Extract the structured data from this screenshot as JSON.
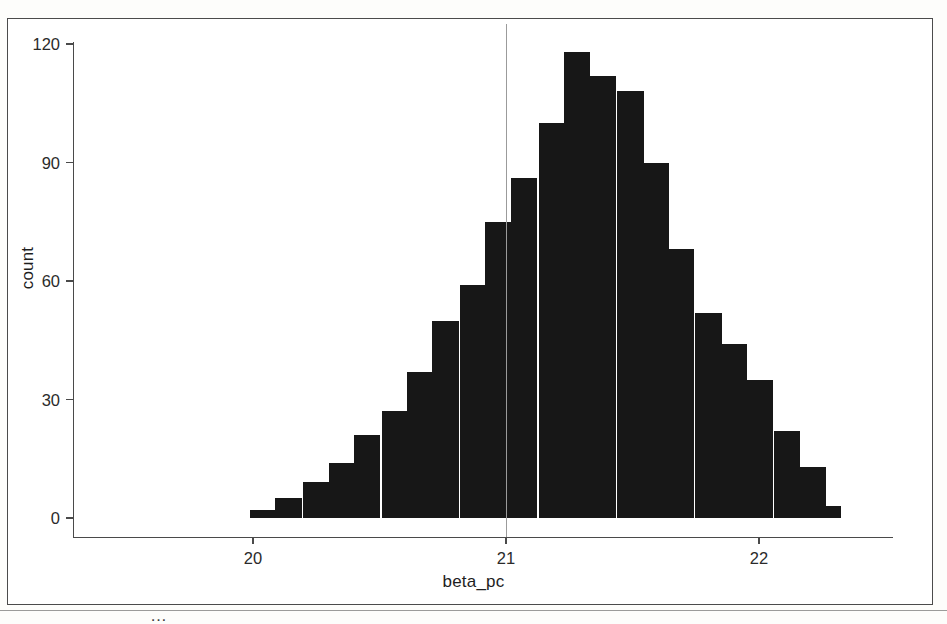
{
  "figure": {
    "kind": "histogram-figure",
    "caption_fragment": "…",
    "frame_color": "#4b4b4b",
    "bar_color": "#171717",
    "reference_line_color": "#9b9b9b",
    "background": "#ffffff"
  },
  "chart_data": {
    "type": "bar",
    "title": "",
    "subtitle": "",
    "xlabel": "beta_pc",
    "ylabel": "count",
    "grid": false,
    "legend": null,
    "xlim": [
      19.93,
      22.3
    ],
    "ylim": [
      0,
      125
    ],
    "xticks": [
      20,
      21,
      22
    ],
    "xtick_labels": [
      "20",
      "21",
      "22"
    ],
    "yticks": [
      0,
      30,
      60,
      90,
      120
    ],
    "ytick_labels": [
      "0",
      "30",
      "60",
      "90",
      "120"
    ],
    "bin_width": 0.103,
    "annotations": [
      {
        "type": "vline",
        "x": 21,
        "label": "",
        "color": "#9b9b9b"
      }
    ],
    "bin_centers": [
      20.04,
      20.14,
      20.25,
      20.35,
      20.45,
      20.56,
      20.66,
      20.76,
      20.87,
      20.97,
      21.07,
      21.18,
      21.28,
      21.38,
      21.49,
      21.59,
      21.69,
      21.8,
      21.9,
      22.0,
      22.11,
      22.21
    ],
    "categories": [
      "20.04",
      "20.14",
      "20.25",
      "20.35",
      "20.45",
      "20.56",
      "20.66",
      "20.76",
      "20.87",
      "20.97",
      "21.07",
      "21.18",
      "21.28",
      "21.38",
      "21.49",
      "21.59",
      "21.69",
      "21.80",
      "21.90",
      "22.00",
      "22.11",
      "22.21"
    ],
    "values": [
      2,
      5,
      9,
      14,
      21,
      27,
      37,
      50,
      59,
      75,
      86,
      100,
      118,
      112,
      108,
      90,
      68,
      52,
      44,
      35,
      22,
      13
    ]
  },
  "extra_bins": {
    "note": "right tail continues",
    "centers": [
      22.21,
      22.27
    ],
    "values": [
      8,
      3
    ]
  }
}
